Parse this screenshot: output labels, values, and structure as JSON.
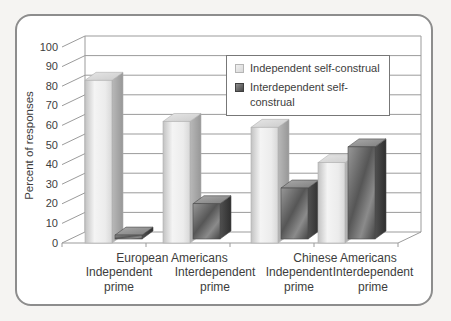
{
  "page": {
    "background": "#f5f4f2"
  },
  "card": {
    "background": "#ffffff",
    "border_color": "#8d8d8d"
  },
  "chart_data": {
    "type": "bar",
    "projection": "3d",
    "title": "",
    "ylabel": "Percent of responses",
    "xlabel": "",
    "y_axis": {
      "min": 0,
      "max": 100,
      "step": 10,
      "ticks": [
        0,
        10,
        20,
        30,
        40,
        50,
        60,
        70,
        80,
        90,
        100
      ]
    },
    "grid": true,
    "legend_position": "top-right",
    "group_labels": [
      "European Americans",
      "Chinese Americans"
    ],
    "categories": [
      "Independent prime",
      "Interdependent prime",
      "Independent prime",
      "Interdependent prime"
    ],
    "series": [
      {
        "name": "Independent self-construal",
        "color": "#ececec",
        "values": [
          83,
          62,
          59,
          41
        ]
      },
      {
        "name": "Interdependent self-construal",
        "color": "#5f5f5f",
        "values": [
          2,
          18,
          26,
          47
        ]
      }
    ]
  }
}
